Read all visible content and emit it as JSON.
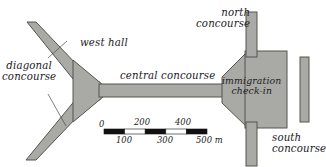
{
  "diagram": {
    "kind": "airport-terminal-floorplan-map",
    "background_color": "#ffffff",
    "corridor_fill": "#a9a9a6",
    "corridor_stroke": "#555552",
    "labels": {
      "diagonal_concourse_line1": "diagonal",
      "diagonal_concourse_line2": "concourse",
      "west_hall": "west hall",
      "central_concourse": "central concourse",
      "north_concourse_line1": "north",
      "north_concourse_line2": "concourse",
      "immigration_line1": "immigration",
      "immigration_line2": "check-in",
      "south_concourse_line1": "south",
      "south_concourse_line2": "concourse"
    },
    "scale_bar": {
      "unit": "m",
      "top_ticks": [
        "0",
        "200",
        "400"
      ],
      "bottom_ticks": [
        "100",
        "300",
        "500"
      ],
      "unit_label": "500 m",
      "max_value": 500,
      "segments": 5,
      "segment_colors": [
        "#111111",
        "#ffffff",
        "#111111",
        "#ffffff",
        "#111111"
      ]
    }
  }
}
